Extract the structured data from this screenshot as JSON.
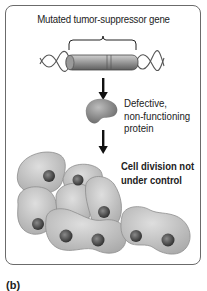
{
  "figure": {
    "gene_label": "Mutated tumor-suppressor gene",
    "protein_label_lines": [
      "Defective,",
      "non-functioning",
      "protein"
    ],
    "cell_label_lines": [
      "Cell division not",
      "under control"
    ],
    "panel_label": "(b)"
  },
  "colors": {
    "border": "#6b6b6b",
    "gene_bar": "#8c8c8c",
    "protein": "#8a8a8a",
    "cell_fill": "#c4c4c4",
    "nucleus": "#555555",
    "arrow": "#111111"
  }
}
